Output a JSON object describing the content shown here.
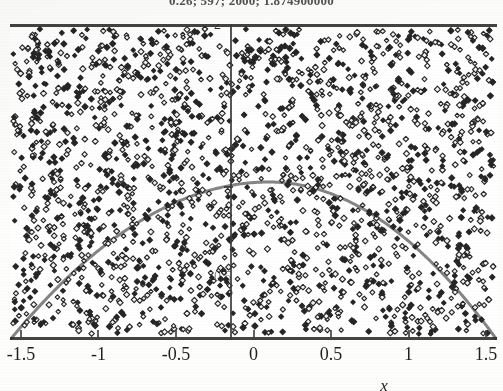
{
  "chart_data": {
    "type": "scatter",
    "title": "0.26; 597; 2000; 1.874900000",
    "xlabel": "x",
    "ylabel": "",
    "xlim": [
      -1.5707963,
      1.5707963
    ],
    "ylim": [
      0,
      2
    ],
    "xticks": [
      "-1.5",
      "-1",
      "-0.5",
      "0",
      "0.5",
      "1",
      "1.5"
    ],
    "xtick_values": [
      -1.5,
      -1,
      -0.5,
      0,
      0.5,
      1,
      1.5
    ],
    "yticks": [
      "2",
      "0.5"
    ],
    "ytick_values": [
      2,
      0.5
    ],
    "grid": false,
    "legend": false,
    "series": [
      {
        "name": "random sample points",
        "type": "scatter",
        "marker": "diamond",
        "marker_color": "#262626",
        "point_count": 2000,
        "note": "uniform random points filling the plot rectangle"
      },
      {
        "name": "f(x) = cos(x) envelope",
        "type": "line",
        "line_color": "#7d7d7d",
        "line_width": 3,
        "peak_x": 0.1,
        "peak_y": 1.0,
        "x_zeros": [
          -1.5707963,
          1.5707963
        ]
      }
    ],
    "annotations": {
      "hits_under_curve": 597,
      "total_points": 2000,
      "ratio": 0.26,
      "estimate": 1.8749
    }
  },
  "axis": {
    "x_tick_labels": [
      {
        "label": "-1.5",
        "value": -1.5
      },
      {
        "label": "-1",
        "value": -1
      },
      {
        "label": "-0.5",
        "value": -0.5
      },
      {
        "label": "0",
        "value": 0
      },
      {
        "label": "0.5",
        "value": 0.5
      },
      {
        "label": "1",
        "value": 1
      },
      {
        "label": "1.5",
        "value": 1.5
      }
    ],
    "y_top_label": "2",
    "y_mid_label": "0.5",
    "x_axis_title": "x"
  },
  "colors": {
    "background": "#ffffff",
    "axis": "#2a2a2a",
    "marker": "#262626",
    "curve": "#7d7d7d",
    "text": "#1f1f1f"
  }
}
